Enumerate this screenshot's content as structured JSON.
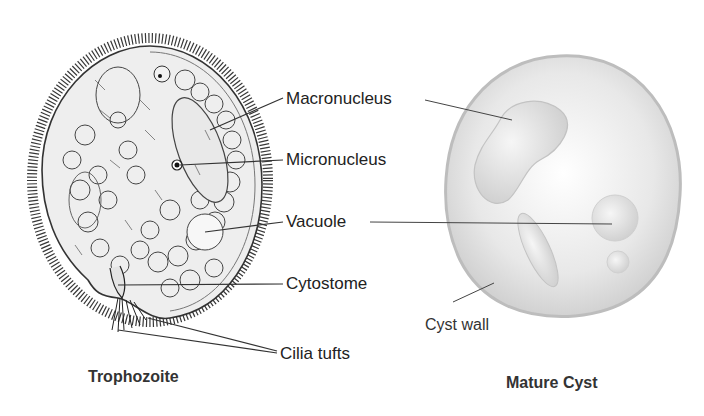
{
  "trophozoite": {
    "title": "Trophozoite",
    "labels": {
      "macronucleus": "Macronucleus",
      "micronucleus": "Micronucleus",
      "vacuole": "Vacuole",
      "cytostome": "Cytostome",
      "cilia_tufts": "Cilia tufts"
    }
  },
  "cyst": {
    "title": "Mature Cyst",
    "labels": {
      "cyst_wall": "Cyst wall"
    }
  },
  "colors": {
    "line": "#333333",
    "cell_fill": "#eeeeee",
    "cyst_fill": "#e6e6e6",
    "cyst_wall": "#b5b5b5"
  }
}
